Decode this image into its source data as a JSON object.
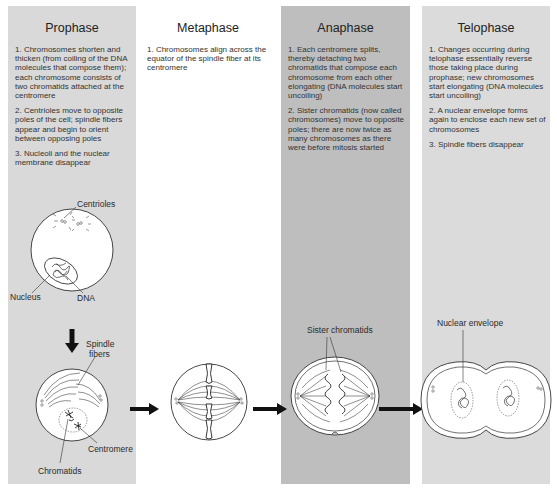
{
  "figure": {
    "panels": [
      {
        "name": "Prophase",
        "background": "#d9d9d9",
        "steps": [
          "1. Chromosomes shorten and thicken (from coiling of the DNA molecules that compose them); each chromosome consists of two chromatids attached at the centromere",
          "2. Centrioles move to opposite poles of the cell; spindle fibers appear and begin to orient between opposing poles",
          "3. Nucleoli and the nuclear membrane disappear"
        ],
        "labels": [
          "Centrioles",
          "Nucleus",
          "DNA",
          "Spindle fibers",
          "Centromere",
          "Chromatids"
        ]
      },
      {
        "name": "Metaphase",
        "background": "#ffffff",
        "steps": [
          "1. Chromosomes align across the equator of the spindle fiber at its centromere"
        ],
        "labels": []
      },
      {
        "name": "Anaphase",
        "background": "#bebebe",
        "steps": [
          "1. Each centromere splits, thereby detaching two chromatids that compose each chromosome from each other elongating (DNA molecules start uncoiling)",
          "2. Sister chromatids (now called chromosomes) move to opposite poles; there are now twice as many chromosomes as there were before mitosis started"
        ],
        "labels": [
          "Sister chromatids"
        ]
      },
      {
        "name": "Telophase",
        "background": "#dbdbdb",
        "steps": [
          "1. Changes occurring during telophase essentially reverse those taking place during prophase; new chromosomes start elongating (DNA molecules start uncoiling)",
          "2. A nuclear envelope forms again to enclose each new set of chromosomes",
          "3. Spindle fibers disappear"
        ],
        "labels": [
          "Nuclear envelope"
        ]
      }
    ],
    "arrows": [
      "prophase-down",
      "prophase-to-metaphase",
      "metaphase-to-anaphase",
      "anaphase-to-telophase"
    ]
  }
}
